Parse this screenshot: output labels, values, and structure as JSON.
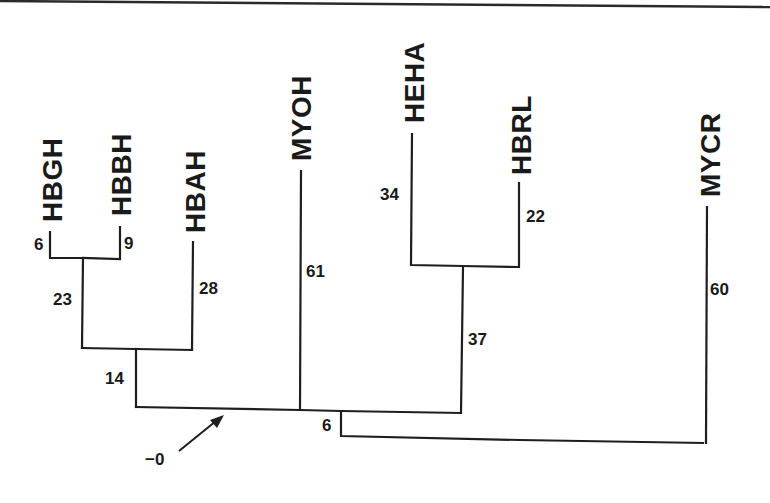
{
  "diagram": {
    "type": "phylogenetic-tree",
    "taxa": [
      {
        "id": "HBGH",
        "label": "HBGH",
        "branch_length": "6"
      },
      {
        "id": "HBBH",
        "label": "HBBH",
        "branch_length": "9"
      },
      {
        "id": "HBAH",
        "label": "HBAH",
        "branch_length": "28"
      },
      {
        "id": "MYOH",
        "label": "MYOH",
        "branch_length": "61"
      },
      {
        "id": "HEHA",
        "label": "HEHA",
        "branch_length": "34"
      },
      {
        "id": "HBRL",
        "label": "HBRL",
        "branch_length": "22"
      },
      {
        "id": "MYCR",
        "label": "MYCR",
        "branch_length": "60"
      }
    ],
    "internal_branches": [
      {
        "id": "HBGH_HBBH",
        "label": "23"
      },
      {
        "id": "HBGH_HBBH_HBAH",
        "label": "14"
      },
      {
        "id": "HEHA_HBRL",
        "label": "37"
      },
      {
        "id": "root_MYCR",
        "label": "6"
      }
    ],
    "root_annotation": {
      "label": "−0",
      "icon": "arrow-icon"
    },
    "colors": {
      "line": "#1e1e1e",
      "text": "#1a1a1a",
      "background": "#ffffff"
    }
  }
}
